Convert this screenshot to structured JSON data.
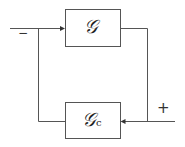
{
  "diagram": {
    "type": "block-diagram",
    "blocks": [
      {
        "id": "plant",
        "label": "𝒢"
      },
      {
        "id": "controller",
        "label": "𝒢",
        "subscript": "c"
      }
    ],
    "signs": {
      "top_input": "−",
      "bottom_input": "+"
    }
  }
}
